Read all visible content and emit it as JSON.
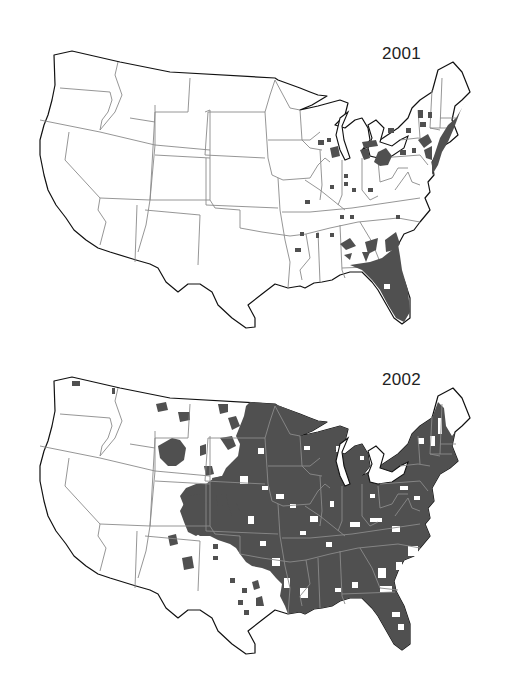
{
  "figure": {
    "type": "choropleth-map-pair",
    "shade_color": "#505050",
    "border_color": "#8a8a8a",
    "outline_color": "#111111",
    "background": "#ffffff"
  },
  "panels": [
    {
      "year_label": "2001",
      "extent_summary": "Shading concentrated in Florida, southern Georgia, scattered counties in Alabama, Georgia, Tennessee, Kentucky, Arkansas, Indiana, Ohio, Michigan, Illinois/Wisconsin, Pennsylvania, New York, and the Northeast coast (New Jersey, Connecticut, Massachusetts, New Hampshire, Maine coast)."
    },
    {
      "year_label": "2002",
      "extent_summary": "Shading covers most of the eastern half of the US from the Great Plains (Dakotas, Nebraska, Kansas, eastern Colorado, Oklahoma, eastern Texas) to the Atlantic coast, plus scattered counties in Montana, Wyoming, New Mexico, western Texas and Washington."
    }
  ]
}
